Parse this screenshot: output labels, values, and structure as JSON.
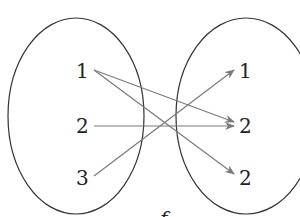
{
  "diagram": {
    "type": "mapping-diagram",
    "function_label": "f",
    "domain": {
      "elements": [
        {
          "label": "1",
          "x": 82,
          "y": 78
        },
        {
          "label": "2",
          "x": 82,
          "y": 133
        },
        {
          "label": "3",
          "x": 82,
          "y": 185
        }
      ]
    },
    "codomain": {
      "elements": [
        {
          "label": "1",
          "x": 246,
          "y": 78
        },
        {
          "label": "2",
          "x": 246,
          "y": 133
        },
        {
          "label": "2",
          "x": 246,
          "y": 185
        }
      ]
    },
    "arrows": [
      {
        "from": "domain.1",
        "to": "codomain.2 (middle)"
      },
      {
        "from": "domain.1",
        "to": "codomain.2 (bottom)"
      },
      {
        "from": "domain.2",
        "to": "codomain.2 (middle)"
      },
      {
        "from": "domain.3",
        "to": "codomain.1"
      }
    ],
    "colors": {
      "ellipse_stroke": "#333333",
      "arrow": "#7a7a7a",
      "text": "#222222"
    }
  }
}
